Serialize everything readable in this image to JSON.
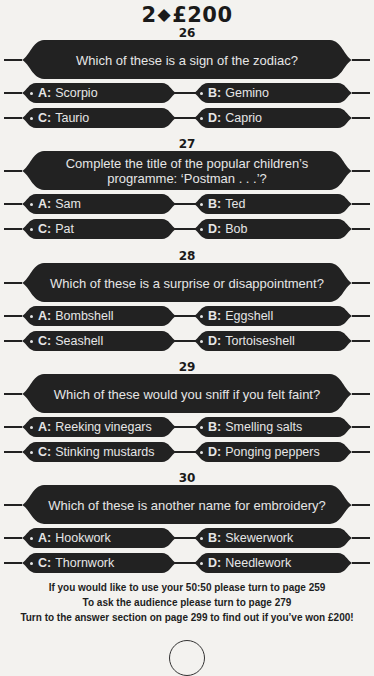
{
  "header": {
    "prize_prefix": "2",
    "diamond_icon": "◆",
    "prize_amount": "£200"
  },
  "questions": [
    {
      "number": "26",
      "text": "Which of these is a sign of the zodiac?",
      "answers": [
        {
          "letter": "A:",
          "text": "Scorpio"
        },
        {
          "letter": "B:",
          "text": "Gemino"
        },
        {
          "letter": "C:",
          "text": "Taurio"
        },
        {
          "letter": "D:",
          "text": "Caprio"
        }
      ]
    },
    {
      "number": "27",
      "text": "Complete the title of the popular children’s programme: ‘Postman . . .’?",
      "answers": [
        {
          "letter": "A:",
          "text": "Sam"
        },
        {
          "letter": "B:",
          "text": "Ted"
        },
        {
          "letter": "C:",
          "text": "Pat"
        },
        {
          "letter": "D:",
          "text": "Bob"
        }
      ]
    },
    {
      "number": "28",
      "text": "Which of these is a surprise or disappointment?",
      "answers": [
        {
          "letter": "A:",
          "text": "Bombshell"
        },
        {
          "letter": "B:",
          "text": "Eggshell"
        },
        {
          "letter": "C:",
          "text": "Seashell"
        },
        {
          "letter": "D:",
          "text": "Tortoiseshell"
        }
      ]
    },
    {
      "number": "29",
      "text": "Which of these would you sniff if you felt faint?",
      "answers": [
        {
          "letter": "A:",
          "text": "Reeking vinegars"
        },
        {
          "letter": "B:",
          "text": "Smelling salts"
        },
        {
          "letter": "C:",
          "text": "Stinking mustards"
        },
        {
          "letter": "D:",
          "text": "Ponging peppers"
        }
      ]
    },
    {
      "number": "30",
      "text": "Which of these is another name for embroidery?",
      "answers": [
        {
          "letter": "A:",
          "text": "Hookwork"
        },
        {
          "letter": "B:",
          "text": "Skewerwork"
        },
        {
          "letter": "C:",
          "text": "Thornwork"
        },
        {
          "letter": "D:",
          "text": "Needlework"
        }
      ]
    }
  ],
  "footer": {
    "line1": "If you would like to use your 50:50 please turn to page 259",
    "line2": "To ask the audience please turn to page 279",
    "line3": "Turn to the answer section on page 299 to find out if you’ve won £200!"
  },
  "colors": {
    "bar_fill": "#222222",
    "bar_text": "#e6e6e6",
    "page_bg": "#f3f2ef"
  }
}
